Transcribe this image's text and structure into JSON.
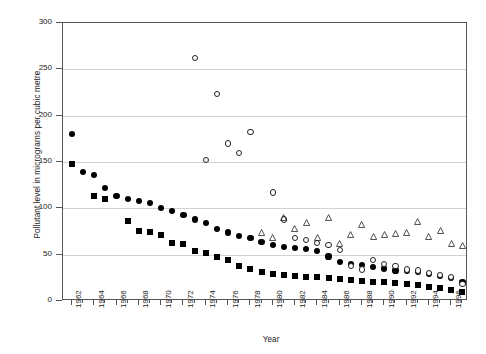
{
  "chart_data": {
    "type": "scatter",
    "title": "",
    "xlabel": "Year",
    "ylabel": "Pollutant level in micrograms per cubic metre",
    "xlim": [
      1961.2,
      1997.5
    ],
    "ylim": [
      0,
      300
    ],
    "yticks": [
      0,
      50,
      100,
      150,
      200,
      250,
      300
    ],
    "xticks": [
      1962,
      1964,
      1966,
      1968,
      1970,
      1972,
      1974,
      1976,
      1978,
      1980,
      1982,
      1984,
      1986,
      1988,
      1990,
      1992,
      1994,
      1996
    ],
    "grid": true,
    "legend_position": "none",
    "series": [
      {
        "name": "filled-circle-series",
        "marker": "filled-circle",
        "color": "#000000",
        "points": [
          [
            1962,
            180
          ],
          [
            1963,
            139
          ],
          [
            1964,
            136
          ],
          [
            1965,
            122
          ],
          [
            1966,
            113
          ],
          [
            1967,
            110
          ],
          [
            1968,
            108
          ],
          [
            1969,
            106
          ],
          [
            1970,
            100
          ],
          [
            1971,
            97
          ],
          [
            1972,
            93
          ],
          [
            1973,
            88
          ],
          [
            1974,
            84
          ],
          [
            1975,
            78
          ],
          [
            1976,
            74
          ],
          [
            1977,
            70
          ],
          [
            1978,
            68
          ],
          [
            1979,
            64
          ],
          [
            1980,
            60
          ],
          [
            1981,
            58
          ],
          [
            1982,
            57
          ],
          [
            1983,
            56
          ],
          [
            1984,
            54
          ],
          [
            1985,
            48
          ],
          [
            1986,
            42
          ],
          [
            1987,
            40
          ],
          [
            1988,
            39
          ],
          [
            1989,
            37
          ],
          [
            1990,
            35
          ],
          [
            1991,
            33
          ],
          [
            1992,
            32
          ],
          [
            1993,
            31
          ],
          [
            1994,
            29
          ],
          [
            1995,
            27
          ],
          [
            1996,
            25
          ],
          [
            1997,
            20
          ]
        ]
      },
      {
        "name": "filled-square-series",
        "marker": "filled-square",
        "color": "#000000",
        "points": [
          [
            1962,
            148
          ],
          [
            1964,
            113
          ],
          [
            1965,
            110
          ],
          [
            1967,
            86
          ],
          [
            1968,
            76
          ],
          [
            1969,
            74
          ],
          [
            1970,
            71
          ],
          [
            1971,
            63
          ],
          [
            1972,
            62
          ],
          [
            1973,
            54
          ],
          [
            1974,
            52
          ],
          [
            1975,
            47
          ],
          [
            1976,
            44
          ],
          [
            1977,
            38
          ],
          [
            1978,
            34
          ],
          [
            1979,
            31
          ],
          [
            1980,
            29
          ],
          [
            1981,
            28
          ],
          [
            1982,
            27
          ],
          [
            1983,
            26
          ],
          [
            1984,
            26
          ],
          [
            1985,
            25
          ],
          [
            1986,
            24
          ],
          [
            1987,
            23
          ],
          [
            1988,
            22
          ],
          [
            1989,
            21
          ],
          [
            1990,
            20
          ],
          [
            1991,
            19
          ],
          [
            1992,
            18
          ],
          [
            1993,
            17
          ],
          [
            1994,
            15
          ],
          [
            1995,
            14
          ],
          [
            1996,
            12
          ],
          [
            1997,
            10
          ]
        ]
      },
      {
        "name": "open-circle-series",
        "marker": "open-circle",
        "color": "#222222",
        "points": [
          [
            1973,
            262
          ],
          [
            1974,
            152
          ],
          [
            1975,
            223
          ],
          [
            1976,
            170
          ],
          [
            1977,
            160
          ],
          [
            1978,
            182
          ],
          [
            1980,
            117
          ],
          [
            1981,
            88
          ],
          [
            1982,
            68
          ],
          [
            1983,
            66
          ],
          [
            1984,
            63
          ],
          [
            1985,
            60
          ],
          [
            1986,
            55
          ],
          [
            1987,
            38
          ],
          [
            1988,
            34
          ],
          [
            1989,
            44
          ],
          [
            1990,
            40
          ],
          [
            1991,
            38
          ],
          [
            1992,
            34
          ],
          [
            1993,
            33
          ],
          [
            1994,
            30
          ],
          [
            1995,
            28
          ],
          [
            1996,
            26
          ],
          [
            1997,
            18
          ]
        ]
      },
      {
        "name": "open-triangle-series",
        "marker": "open-triangle",
        "color": "#222222",
        "points": [
          [
            1979,
            74
          ],
          [
            1980,
            68
          ],
          [
            1981,
            90
          ],
          [
            1982,
            78
          ],
          [
            1983,
            85
          ],
          [
            1984,
            68
          ],
          [
            1985,
            90
          ],
          [
            1986,
            62
          ],
          [
            1987,
            72
          ],
          [
            1988,
            82
          ],
          [
            1989,
            70
          ],
          [
            1990,
            72
          ],
          [
            1991,
            73
          ],
          [
            1992,
            74
          ],
          [
            1993,
            86
          ],
          [
            1994,
            70
          ],
          [
            1995,
            76
          ],
          [
            1996,
            62
          ],
          [
            1997,
            60
          ]
        ]
      }
    ]
  },
  "axes": {
    "y_title": "Pollutant level in micrograms per cubic metre",
    "x_title": "Year"
  }
}
